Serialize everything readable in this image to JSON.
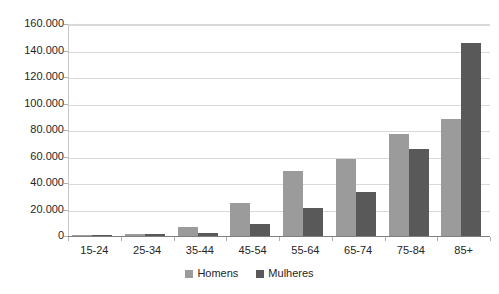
{
  "chart_data": {
    "type": "bar",
    "title": "",
    "subtitle": "",
    "xlabel": "",
    "ylabel": "",
    "categories": [
      "15-24",
      "25-34",
      "35-44",
      "45-54",
      "55-64",
      "65-74",
      "75-84",
      "85+"
    ],
    "series": [
      {
        "name": "Homens",
        "color": "#9b9b9b",
        "values": [
          600,
          1600,
          7000,
          25000,
          49000,
          58000,
          77000,
          88000
        ]
      },
      {
        "name": "Mulheres",
        "color": "#595959",
        "values": [
          300,
          1200,
          2200,
          9000,
          21000,
          33000,
          66000,
          146000
        ]
      }
    ],
    "ylim": [
      0,
      160000
    ],
    "ytick_step": 20000,
    "ytick_labels": [
      "160.000",
      "140.000",
      "120.000",
      "100.000",
      "80.000",
      "60.000",
      "40.000",
      "20.000",
      "0"
    ],
    "ytick_values": [
      160000,
      140000,
      120000,
      100000,
      80000,
      60000,
      40000,
      20000,
      0
    ],
    "grid": true,
    "grid_axis": "y",
    "legend_position": "bottom",
    "legend_entries": [
      "Homens",
      "Mulheres"
    ],
    "plot_background": "#ffffff",
    "gridline_color": "#d9d9d9",
    "axis_color": "#808080"
  }
}
